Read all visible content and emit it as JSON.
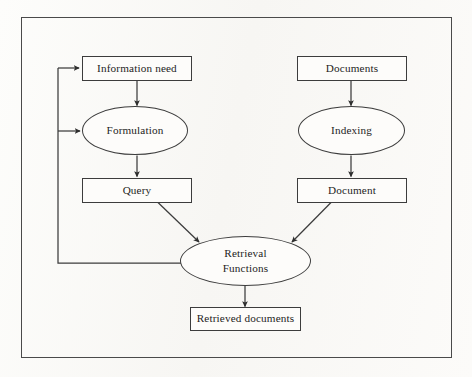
{
  "diagram": {
    "frame": {
      "border_color": "#4a4a4a"
    },
    "background_color": "#fbfaf8",
    "line_color": "#3c3c3c",
    "text_color": "#1d1d1d",
    "nodes": [
      {
        "id": "information-need",
        "label": "Information need",
        "shape": "box",
        "column": "left"
      },
      {
        "id": "formulation",
        "label": "Formulation",
        "shape": "ellipse",
        "column": "left"
      },
      {
        "id": "query",
        "label": "Query",
        "shape": "box",
        "column": "left"
      },
      {
        "id": "documents",
        "label": "Documents",
        "shape": "box",
        "column": "right"
      },
      {
        "id": "indexing",
        "label": "Indexing",
        "shape": "ellipse",
        "column": "right"
      },
      {
        "id": "document",
        "label": "Document",
        "shape": "box",
        "column": "right"
      },
      {
        "id": "retrieval-functions",
        "label_line1": "Retrieval",
        "label_line2": "Functions",
        "shape": "ellipse",
        "column": "center"
      },
      {
        "id": "retrieved-documents",
        "label": "Retrieved documents",
        "shape": "box",
        "column": "center"
      }
    ],
    "edges": [
      {
        "from": "information-need",
        "to": "formulation",
        "style": "straight-down"
      },
      {
        "from": "formulation",
        "to": "query",
        "style": "straight-down"
      },
      {
        "from": "query",
        "to": "retrieval-functions",
        "style": "diagonal"
      },
      {
        "from": "documents",
        "to": "indexing",
        "style": "straight-down"
      },
      {
        "from": "indexing",
        "to": "document",
        "style": "straight-down"
      },
      {
        "from": "document",
        "to": "retrieval-functions",
        "style": "diagonal"
      },
      {
        "from": "retrieval-functions",
        "to": "retrieved-documents",
        "style": "straight-down"
      },
      {
        "from": "retrieval-functions",
        "to": "information-need",
        "style": "feedback-loop"
      },
      {
        "from": "retrieval-functions",
        "to": "formulation",
        "style": "feedback-loop"
      }
    ]
  }
}
